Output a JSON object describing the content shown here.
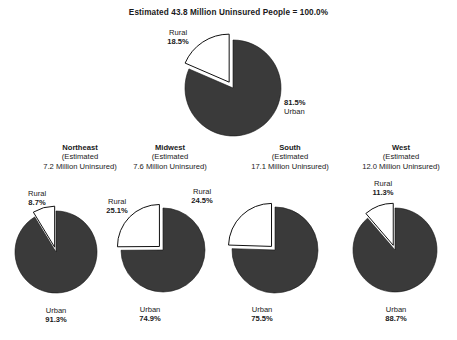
{
  "title": "Estimated 43.8 Million Uninsured People = 100.0%",
  "colors": {
    "urban_slice": "#3a3a3a",
    "rural_slice": "#ffffff",
    "outline": "#111111",
    "text": "#1a1a1a",
    "background": "#ffffff"
  },
  "labels": {
    "rural": "Rural",
    "urban": "Urban",
    "estimated_prefix": "(Estimated"
  },
  "national": {
    "rural_label": "Rural",
    "rural_pct": "18.5%",
    "urban_label": "Urban",
    "urban_pct": "81.5%"
  },
  "regions": [
    {
      "name": "Northeast",
      "est_line1": "(Estimated",
      "est_line2": "7.2 Million Uninsured)",
      "rural_label": "Rural",
      "rural_pct": "8.7%",
      "urban_label": "Urban",
      "urban_pct": "91.3%"
    },
    {
      "name": "Midwest",
      "est_line1": "(Estimated",
      "est_line2": "7.6 Million Uninsured)",
      "rural_label": "Rural",
      "rural_pct": "25.1%",
      "urban_label": "Urban",
      "urban_pct": "74.9%"
    },
    {
      "name": "South",
      "est_line1": "(Estimated",
      "est_line2": "17.1 Million Uninsured)",
      "rural_label": "Rural",
      "rural_pct": "24.5%",
      "urban_label": "Urban",
      "urban_pct": "75.5%"
    },
    {
      "name": "West",
      "est_line1": "(Estimated",
      "est_line2": "12.0 Million Uninsured)",
      "rural_label": "Rural",
      "rural_pct": "11.3%",
      "urban_label": "Urban",
      "urban_pct": "88.7%"
    }
  ],
  "chart_data": {
    "type": "pie",
    "title": "Estimated 43.8 Million Uninsured People = 100.0%",
    "xlabel": "",
    "ylabel": "",
    "legend": "none",
    "grid": false,
    "series_labels": [
      "Rural",
      "Urban"
    ],
    "charts": [
      {
        "name": "National",
        "subtitle": "Estimated 43.8 Million Uninsured People = 100.0%",
        "total_millions": 43.8,
        "categories": [
          "Rural",
          "Urban"
        ],
        "values": [
          18.5,
          81.5
        ],
        "exploded": [
          "Rural"
        ],
        "colors": [
          "#ffffff",
          "#3a3a3a"
        ]
      },
      {
        "name": "Northeast",
        "subtitle": "(Estimated 7.2 Million Uninsured)",
        "total_millions": 7.2,
        "categories": [
          "Rural",
          "Urban"
        ],
        "values": [
          8.7,
          91.3
        ],
        "exploded": [
          "Rural"
        ],
        "colors": [
          "#ffffff",
          "#3a3a3a"
        ]
      },
      {
        "name": "Midwest",
        "subtitle": "(Estimated 7.6 Million Uninsured)",
        "total_millions": 7.6,
        "categories": [
          "Rural",
          "Urban"
        ],
        "values": [
          25.1,
          74.9
        ],
        "exploded": [
          "Rural"
        ],
        "colors": [
          "#ffffff",
          "#3a3a3a"
        ]
      },
      {
        "name": "South",
        "subtitle": "(Estimated 17.1 Million Uninsured)",
        "total_millions": 17.1,
        "categories": [
          "Rural",
          "Urban"
        ],
        "values": [
          24.5,
          75.5
        ],
        "exploded": [
          "Rural"
        ],
        "colors": [
          "#ffffff",
          "#3a3a3a"
        ]
      },
      {
        "name": "West",
        "subtitle": "(Estimated 12.0 Million Uninsured)",
        "total_millions": 12.0,
        "categories": [
          "Rural",
          "Urban"
        ],
        "values": [
          11.3,
          88.7
        ],
        "exploded": [
          "Rural"
        ],
        "colors": [
          "#ffffff",
          "#3a3a3a"
        ]
      }
    ]
  }
}
